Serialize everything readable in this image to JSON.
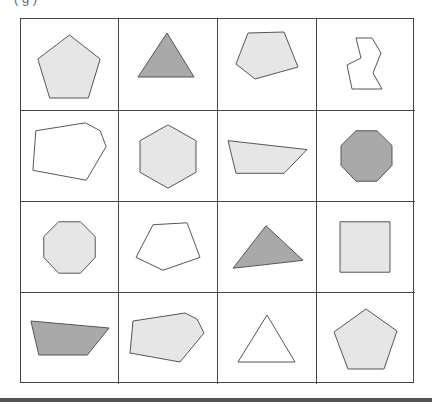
{
  "caption": "(                                   g      )",
  "colors": {
    "dark_fill": "#a9a9a9",
    "light_fill": "#e6e6e6",
    "none_fill": "#ffffff",
    "stroke": "#555555"
  },
  "grid": {
    "rows": 4,
    "cols": 4,
    "cells": [
      {
        "shape": "pentagon",
        "fill": "light",
        "points": "49,16 80,40 68,79 29,79 17,40"
      },
      {
        "shape": "triangle",
        "fill": "dark",
        "points": "48,14 75,58 19,58"
      },
      {
        "shape": "pentagon-irregular",
        "fill": "light",
        "points": "30,14 66,13 80,48 37,60 18,45"
      },
      {
        "shape": "irregular-octagon-outline",
        "fill": "none",
        "points": "39,19 55,19 64,34 56,54 65,70 35,70 30,46 44,39"
      },
      {
        "shape": "hexagon-irregular",
        "fill": "none",
        "points": "15,20 65,12 80,20 86,36 66,70 12,60"
      },
      {
        "shape": "hexagon",
        "fill": "light",
        "points": "49,14 77,30 77,62 49,78 21,62 21,30"
      },
      {
        "shape": "quadrilateral",
        "fill": "light",
        "points": "10,30 89,39 66,63 18,63"
      },
      {
        "shape": "octagon",
        "fill": "dark",
        "points": "39,20 60,20 75,35 75,55 60,71 39,71 24,55 24,35"
      },
      {
        "shape": "octagon",
        "fill": "light",
        "points": "38,20 60,20 75,35 75,56 60,72 38,72 23,56 23,35"
      },
      {
        "shape": "pentagon-irregular",
        "fill": "none",
        "points": "34,23 68,21 81,56 44,69 17,56"
      },
      {
        "shape": "triangle-scalene",
        "fill": "dark",
        "points": "48,24 85,59 15,67"
      },
      {
        "shape": "square",
        "fill": "light",
        "points": "23,20 73,20 73,71 23,71"
      },
      {
        "shape": "quadrilateral",
        "fill": "dark",
        "points": "10,28 89,35 67,62 18,62"
      },
      {
        "shape": "hexagon-irregular",
        "fill": "light",
        "points": "14,28 66,20 78,26 85,40 61,69 11,60"
      },
      {
        "shape": "triangle",
        "fill": "none",
        "points": "49,22 77,69 20,69"
      },
      {
        "shape": "pentagon",
        "fill": "light",
        "points": "49,16 80,38 67,76 31,76 17,39"
      }
    ]
  }
}
